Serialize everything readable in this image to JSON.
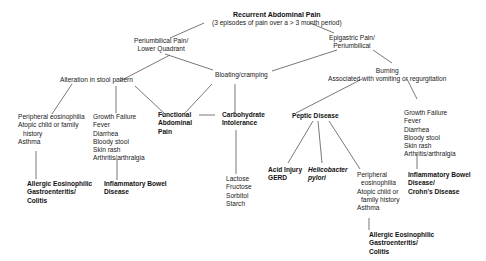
{
  "root": {
    "title": "Recurrent Abdominal Pain",
    "subtitle": "(3 episodes of pain over a > 3 month period)"
  },
  "periumbilical": {
    "lines": [
      "Periumbilical Pain/",
      "Lower Quadrant"
    ]
  },
  "epigastric": {
    "lines": [
      "Epigastric Pain/",
      "Periumbilical"
    ]
  },
  "stool": {
    "label": "Alteration in stool pattern"
  },
  "bloating": {
    "label": "Bloating/cramping"
  },
  "burning": {
    "lines": [
      "Burning",
      "Associated with vomiting or regurgitation"
    ]
  },
  "left_eos": {
    "lines": [
      "Peripheral eosinophilia",
      "Atopic child or family",
      "history",
      "Asthma"
    ]
  },
  "left_growth": {
    "lines": [
      "Growth Failure",
      "Fever",
      "Diarrhea",
      "Bloody stool",
      "Skin rash",
      "Arthritis/arthralgia"
    ]
  },
  "functional": {
    "lines": [
      "Functional",
      "Abdominal",
      "Pain"
    ]
  },
  "carb": {
    "lines": [
      "Carbohydrate",
      "Intolerance"
    ]
  },
  "sugars": {
    "lines": [
      "Lactose",
      "Fructose",
      "Sorbitol",
      "Starch"
    ]
  },
  "left_allergic": {
    "lines": [
      "Allergic Eosinophilic",
      "Gastroenteritis/",
      "Colitis"
    ]
  },
  "left_ibd": {
    "lines": [
      "Inflammatory Bowel",
      "Disease"
    ]
  },
  "peptic": {
    "label": "Peptic Disease"
  },
  "acid": {
    "lines": [
      "Acid Injury",
      "GERD"
    ]
  },
  "hpylori": {
    "lines": [
      "Helicobacter",
      "pylori"
    ]
  },
  "right_eos": {
    "lines": [
      "Peripheral",
      "eosinophilia",
      "Atopic child or",
      "family history",
      "Asthma"
    ]
  },
  "right_growth": {
    "lines": [
      "Growth Failure",
      "Fever",
      "Diarrhea",
      "Bloody stool",
      "Skin rash",
      "Arthritis/arthralgia"
    ]
  },
  "right_ibd": {
    "lines": [
      "Inflammatory Bowel",
      "Disease/",
      "Crohn's Disease"
    ]
  },
  "right_allergic": {
    "lines": [
      "Allergic Eosinophilic",
      "Gastroenteritis/",
      "Colitis"
    ]
  }
}
